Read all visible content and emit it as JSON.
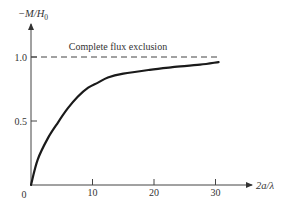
{
  "chart_data": {
    "type": "line",
    "title": "",
    "xlabel": "2a/λ",
    "ylabel": "−M/H₀",
    "xlim": [
      0,
      33
    ],
    "ylim": [
      0,
      1.1
    ],
    "x_ticks": [
      0,
      10,
      20,
      30
    ],
    "y_ticks": [
      0.5,
      1.0
    ],
    "x_tick_labels": [
      "0",
      "10",
      "20",
      "30"
    ],
    "y_tick_labels": [
      "0.5",
      "1.0"
    ],
    "grid": false,
    "legend": null,
    "series": [
      {
        "name": "Magnetization curve",
        "style": "solid",
        "color": "#1a1a1a",
        "x": [
          0,
          1.1,
          2.8,
          4.4,
          6.0,
          7.6,
          9.3,
          10.9,
          12.5,
          15.0,
          19.3,
          23.0,
          27.5,
          30.5
        ],
        "y": [
          0,
          0.2,
          0.37,
          0.49,
          0.6,
          0.69,
          0.76,
          0.8,
          0.84,
          0.87,
          0.9,
          0.92,
          0.94,
          0.96
        ]
      },
      {
        "name": "Complete flux exclusion",
        "style": "dashed",
        "color": "#333333",
        "x": [
          0,
          30.5
        ],
        "y": [
          1.0,
          1.0
        ]
      }
    ],
    "annotations": [
      {
        "text": "Complete flux exclusion",
        "x": 15,
        "y": 1.04
      }
    ]
  },
  "labels": {
    "y_axis": "−M/H",
    "y_axis_sub": "0",
    "x_axis": "2a/λ",
    "origin": "0",
    "annotation": "Complete flux exclusion"
  }
}
